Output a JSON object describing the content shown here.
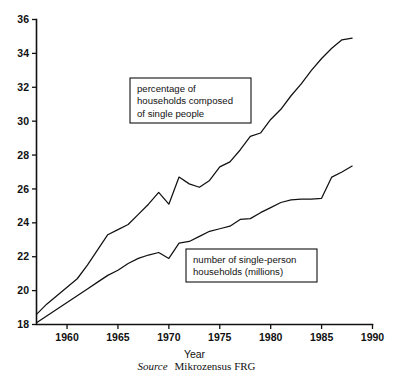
{
  "figure": {
    "source_label": "Source",
    "source_value": "Mikrozensus FRG"
  },
  "chart_data": {
    "type": "line",
    "title": "",
    "xlabel": "Year",
    "ylabel": "",
    "xlim": [
      1957,
      1990
    ],
    "ylim": [
      18,
      36
    ],
    "xticks": [
      1960,
      1965,
      1970,
      1975,
      1980,
      1985,
      1990
    ],
    "xtick_labels": [
      "1960",
      "1965",
      "1970",
      "1975",
      "1980",
      "1985",
      "1990"
    ],
    "yticks": [
      18,
      20,
      22,
      24,
      26,
      28,
      30,
      32,
      34,
      36
    ],
    "ytick_labels": [
      "18",
      "20",
      "22",
      "24",
      "26",
      "28",
      "30",
      "32",
      "34",
      "36"
    ],
    "grid": false,
    "legend": "annotation-boxes",
    "series": [
      {
        "name": "percentage of households composed of single people",
        "x": [
          1957,
          1958,
          1959,
          1960,
          1961,
          1962,
          1963,
          1964,
          1965,
          1966,
          1967,
          1968,
          1969,
          1970,
          1971,
          1972,
          1973,
          1974,
          1975,
          1976,
          1977,
          1978,
          1979,
          1980,
          1981,
          1982,
          1983,
          1984,
          1985,
          1986,
          1987,
          1988
        ],
        "y": [
          18.6,
          19.2,
          19.7,
          20.2,
          20.7,
          21.5,
          22.4,
          23.3,
          23.6,
          23.9,
          24.5,
          25.1,
          25.8,
          25.1,
          26.7,
          26.3,
          26.1,
          26.5,
          27.3,
          27.6,
          28.3,
          29.1,
          29.3,
          30.1,
          30.7,
          31.5,
          32.2,
          33.0,
          33.7,
          34.3,
          34.8,
          34.9
        ]
      },
      {
        "name": "number of single-person households (millions)",
        "x": [
          1957,
          1958,
          1959,
          1960,
          1961,
          1962,
          1963,
          1964,
          1965,
          1966,
          1967,
          1968,
          1969,
          1970,
          1971,
          1972,
          1973,
          1974,
          1975,
          1976,
          1977,
          1978,
          1979,
          1980,
          1981,
          1982,
          1983,
          1984,
          1985,
          1986,
          1987,
          1988
        ],
        "y": [
          18.1,
          18.5,
          18.9,
          19.3,
          19.7,
          20.1,
          20.5,
          20.9,
          21.2,
          21.6,
          21.9,
          22.1,
          22.25,
          21.9,
          22.8,
          22.9,
          23.2,
          23.5,
          23.65,
          23.8,
          24.2,
          24.25,
          24.6,
          24.9,
          25.2,
          25.35,
          25.4,
          25.4,
          25.45,
          26.7,
          27.0,
          27.35
        ]
      }
    ],
    "annotations": [
      {
        "id": "upper-series-label",
        "lines": [
          "percentage of",
          "households composed",
          "of single people"
        ],
        "box": {
          "x": 130,
          "y": 78,
          "width": 121,
          "height": 45
        }
      },
      {
        "id": "lower-series-label",
        "lines": [
          "number of single-person",
          "households (millions)"
        ],
        "box": {
          "x": 186,
          "y": 249,
          "width": 131,
          "height": 33
        }
      }
    ]
  }
}
